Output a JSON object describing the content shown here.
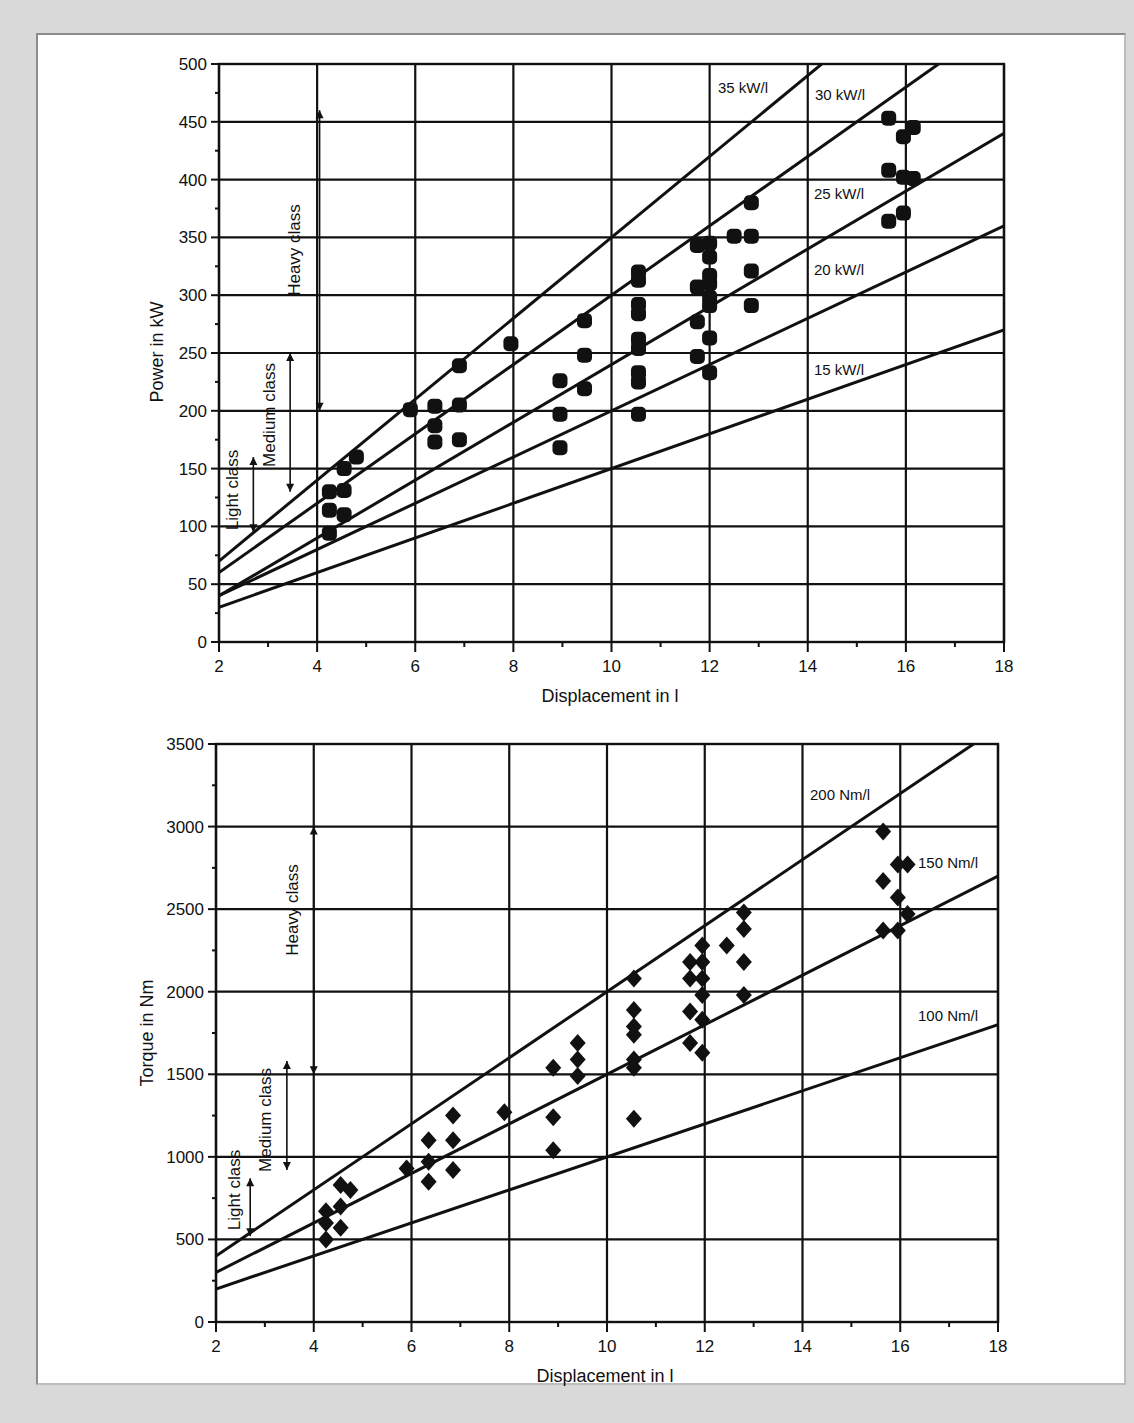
{
  "chart_data": [
    {
      "type": "scatter",
      "title": "",
      "xlabel": "Displacement in l",
      "ylabel": "Power in kW",
      "xlim": [
        2,
        18
      ],
      "ylim": [
        0,
        500
      ],
      "xticks": [
        2,
        4,
        6,
        8,
        10,
        12,
        14,
        16,
        18
      ],
      "yticks": [
        0,
        50,
        100,
        150,
        200,
        250,
        300,
        350,
        400,
        450,
        500
      ],
      "grid": true,
      "marker": "circle",
      "reference_lines": [
        {
          "label": "35 kW/l",
          "x0": 2,
          "y0": 70,
          "slope": 35
        },
        {
          "label": "30 kW/l",
          "x0": 2,
          "y0": 60,
          "slope": 30
        },
        {
          "label": "25 kW/l",
          "x0": 2,
          "y0": 40,
          "slope": 25
        },
        {
          "label": "20 kW/l",
          "x0": 2,
          "y0": 40,
          "slope": 20
        },
        {
          "label": "15 kW/l",
          "x0": 2,
          "y0": 30,
          "slope": 15
        }
      ],
      "class_ranges": [
        {
          "label": "Light class",
          "x": 2.7,
          "ymin": 95,
          "ymax": 160
        },
        {
          "label": "Medium class",
          "x": 3.45,
          "ymin": 130,
          "ymax": 250
        },
        {
          "label": "Heavy class",
          "x": 4.05,
          "ymin": 200,
          "ymax": 460
        }
      ],
      "points": [
        [
          4.25,
          130
        ],
        [
          4.25,
          114
        ],
        [
          4.25,
          94
        ],
        [
          4.55,
          150
        ],
        [
          4.55,
          131
        ],
        [
          4.55,
          110
        ],
        [
          4.8,
          160
        ],
        [
          5.9,
          201
        ],
        [
          6.4,
          204
        ],
        [
          6.4,
          187
        ],
        [
          6.4,
          173
        ],
        [
          6.9,
          239
        ],
        [
          6.9,
          205
        ],
        [
          6.9,
          175
        ],
        [
          7.95,
          258
        ],
        [
          8.95,
          226
        ],
        [
          8.95,
          197
        ],
        [
          8.95,
          168
        ],
        [
          9.45,
          278
        ],
        [
          9.45,
          248
        ],
        [
          9.45,
          219
        ],
        [
          10.55,
          320
        ],
        [
          10.55,
          313
        ],
        [
          10.55,
          292
        ],
        [
          10.55,
          284
        ],
        [
          10.55,
          262
        ],
        [
          10.55,
          254
        ],
        [
          10.55,
          233
        ],
        [
          10.55,
          225
        ],
        [
          10.55,
          197
        ],
        [
          11.75,
          343
        ],
        [
          11.75,
          307
        ],
        [
          11.75,
          277
        ],
        [
          11.75,
          247
        ],
        [
          12.0,
          345
        ],
        [
          12.0,
          333
        ],
        [
          12.0,
          317
        ],
        [
          12.0,
          310
        ],
        [
          12.0,
          298
        ],
        [
          12.0,
          291
        ],
        [
          12.0,
          263
        ],
        [
          12.0,
          233
        ],
        [
          12.5,
          351
        ],
        [
          12.85,
          380
        ],
        [
          12.85,
          351
        ],
        [
          12.85,
          321
        ],
        [
          12.85,
          291
        ],
        [
          15.65,
          453
        ],
        [
          15.65,
          408
        ],
        [
          15.65,
          364
        ],
        [
          15.95,
          437
        ],
        [
          15.95,
          402
        ],
        [
          15.95,
          371
        ],
        [
          16.15,
          445
        ],
        [
          16.15,
          401
        ]
      ]
    },
    {
      "type": "scatter",
      "title": "",
      "xlabel": "Displacement in l",
      "ylabel": "Torque in Nm",
      "xlim": [
        2,
        18
      ],
      "ylim": [
        0,
        3500
      ],
      "xticks": [
        2,
        4,
        6,
        8,
        10,
        12,
        14,
        16,
        18
      ],
      "yticks": [
        0,
        500,
        1000,
        1500,
        2000,
        2500,
        3000,
        3500
      ],
      "grid": true,
      "marker": "diamond",
      "reference_lines": [
        {
          "label": "200 Nm/l",
          "x0": 2,
          "y0": 400,
          "slope": 200
        },
        {
          "label": "150 Nm/l",
          "x0": 2,
          "y0": 300,
          "slope": 150
        },
        {
          "label": "100 Nm/l",
          "x0": 2,
          "y0": 200,
          "slope": 100
        }
      ],
      "class_ranges": [
        {
          "label": "Light class",
          "x": 2.7,
          "ymin": 520,
          "ymax": 870
        },
        {
          "label": "Medium class",
          "x": 3.45,
          "ymin": 920,
          "ymax": 1580
        },
        {
          "label": "Heavy class",
          "x": 4.0,
          "ymin": 1500,
          "ymax": 3000
        }
      ],
      "points": [
        [
          4.25,
          670
        ],
        [
          4.25,
          600
        ],
        [
          4.25,
          500
        ],
        [
          4.55,
          830
        ],
        [
          4.55,
          700
        ],
        [
          4.55,
          570
        ],
        [
          4.75,
          800
        ],
        [
          5.9,
          930
        ],
        [
          6.35,
          1100
        ],
        [
          6.35,
          970
        ],
        [
          6.35,
          850
        ],
        [
          6.85,
          1250
        ],
        [
          6.85,
          1100
        ],
        [
          6.85,
          920
        ],
        [
          7.9,
          1270
        ],
        [
          8.9,
          1540
        ],
        [
          8.9,
          1240
        ],
        [
          8.9,
          1040
        ],
        [
          9.4,
          1690
        ],
        [
          9.4,
          1590
        ],
        [
          9.4,
          1490
        ],
        [
          10.55,
          2080
        ],
        [
          10.55,
          1890
        ],
        [
          10.55,
          1790
        ],
        [
          10.55,
          1740
        ],
        [
          10.55,
          1590
        ],
        [
          10.55,
          1540
        ],
        [
          10.55,
          1230
        ],
        [
          11.7,
          2180
        ],
        [
          11.7,
          2080
        ],
        [
          11.7,
          1880
        ],
        [
          11.7,
          1690
        ],
        [
          11.95,
          2280
        ],
        [
          11.95,
          2180
        ],
        [
          11.95,
          2080
        ],
        [
          11.95,
          1980
        ],
        [
          11.95,
          1830
        ],
        [
          11.95,
          1630
        ],
        [
          12.45,
          2280
        ],
        [
          12.8,
          2480
        ],
        [
          12.8,
          2380
        ],
        [
          12.8,
          2180
        ],
        [
          12.8,
          1980
        ],
        [
          15.65,
          2970
        ],
        [
          15.65,
          2670
        ],
        [
          15.65,
          2370
        ],
        [
          15.95,
          2770
        ],
        [
          15.95,
          2570
        ],
        [
          15.95,
          2370
        ],
        [
          16.15,
          2770
        ],
        [
          16.15,
          2470
        ]
      ]
    }
  ],
  "charts": {
    "power": {
      "xlabel": "Displacement in l",
      "ylabel": "Power in kW",
      "line_labels": [
        "35 kW/l",
        "30 kW/l",
        "25 kW/l",
        "20 kW/l",
        "15 kW/l"
      ],
      "class_labels": [
        "Light class",
        "Medium class",
        "Heavy class"
      ]
    },
    "torque": {
      "xlabel": "Displacement in l",
      "ylabel": "Torque in Nm",
      "line_labels": [
        "200 Nm/l",
        "150 Nm/l",
        "100 Nm/l"
      ],
      "class_labels": [
        "Light class",
        "Medium class",
        "Heavy class"
      ]
    }
  },
  "colors": {
    "background": "#d9d9d9",
    "panel": "#ffffff",
    "ink": "#111111"
  }
}
